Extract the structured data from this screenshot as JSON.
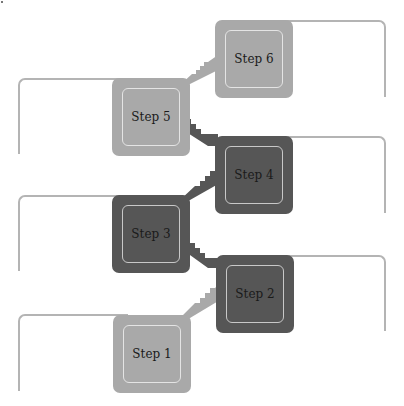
{
  "diagram": {
    "type": "staircase-process",
    "steps": [
      {
        "label": "Step 1",
        "shade": "light"
      },
      {
        "label": "Step 2",
        "shade": "dark"
      },
      {
        "label": "Step 3",
        "shade": "dark"
      },
      {
        "label": "Step 4",
        "shade": "dark"
      },
      {
        "label": "Step 5",
        "shade": "light"
      },
      {
        "label": "Step 6",
        "shade": "light"
      }
    ]
  },
  "colors": {
    "light_box": "#a9a9a9",
    "dark_box": "#565656",
    "bracket_line": "#b4b4b4",
    "inner_border": "#e4e4e4"
  }
}
